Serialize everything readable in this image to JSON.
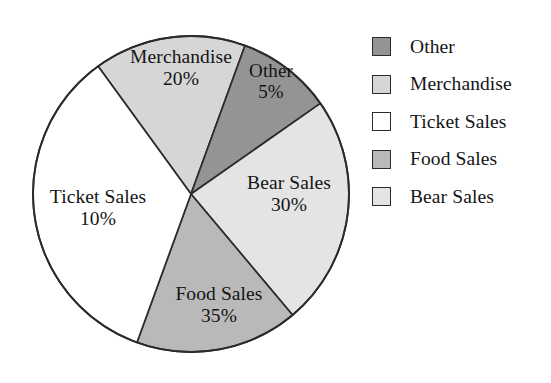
{
  "figure": {
    "type": "pie-chart-figure",
    "background": "#ffffff"
  },
  "chart_data": {
    "type": "pie",
    "title": "",
    "subtitle": "",
    "xlabel": "",
    "ylabel": "",
    "grid": false,
    "legend_position": "right",
    "unit": "%",
    "center": {
      "x": 191,
      "y": 194
    },
    "radius": 158,
    "labels": [
      "Merchandise",
      "Other",
      "Bear Sales",
      "Food Sales",
      "Ticket Sales"
    ],
    "values": [
      20,
      5,
      30,
      35,
      10
    ],
    "value_text": [
      "20%",
      "5%",
      "30%",
      "35%",
      "10%"
    ],
    "colors": [
      "#d6d6d6",
      "#949494",
      "#e4e4e4",
      "#b9b9b9",
      "#ffffff"
    ],
    "stroke": "#2b2b2b",
    "slices": [
      {
        "name": "Merchandise",
        "label": "Merchandise",
        "value": 20,
        "value_text": "20%",
        "color": "#d6d6d6",
        "start_angle": -126,
        "end_angle": -70
      },
      {
        "name": "Other",
        "label": "Other",
        "value": 5,
        "value_text": "5%",
        "color": "#949494",
        "start_angle": -70,
        "end_angle": -35
      },
      {
        "name": "Bear Sales",
        "label": "Bear Sales",
        "value": 30,
        "value_text": "30%",
        "color": "#e4e4e4",
        "start_angle": -35,
        "end_angle": 50
      },
      {
        "name": "Food Sales",
        "label": "Food Sales",
        "value": 35,
        "value_text": "35%",
        "color": "#b9b9b9",
        "start_angle": 50,
        "end_angle": 110
      },
      {
        "name": "Ticket Sales",
        "label": "Ticket Sales",
        "value": 10,
        "value_text": "10%",
        "color": "#ffffff",
        "start_angle": 110,
        "end_angle": 234
      }
    ],
    "legend": [
      {
        "label": "Other",
        "color": "#949494"
      },
      {
        "label": "Merchandise",
        "color": "#d6d6d6"
      },
      {
        "label": "Ticket Sales",
        "color": "#ffffff"
      },
      {
        "label": "Food Sales",
        "color": "#b9b9b9"
      },
      {
        "label": "Bear Sales",
        "color": "#e4e4e4"
      }
    ]
  }
}
